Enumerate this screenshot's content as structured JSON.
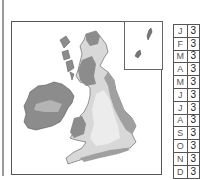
{
  "map": {
    "region": "British Isles",
    "shading_colors": {
      "dark": "#8c8c8c",
      "medium": "#b4b4b4",
      "light": "#d8d8d8",
      "lightest": "#ececec"
    },
    "inset": "Shetland Islands"
  },
  "legend_table": {
    "rows": [
      {
        "month": "J",
        "value": "3"
      },
      {
        "month": "F",
        "value": "3"
      },
      {
        "month": "M",
        "value": "3"
      },
      {
        "month": "A",
        "value": "3"
      },
      {
        "month": "M",
        "value": "3"
      },
      {
        "month": "J",
        "value": "3"
      },
      {
        "month": "J",
        "value": "3"
      },
      {
        "month": "A",
        "value": "3"
      },
      {
        "month": "S",
        "value": "3"
      },
      {
        "month": "O",
        "value": "3"
      },
      {
        "month": "N",
        "value": "3"
      },
      {
        "month": "D",
        "value": "3"
      }
    ]
  }
}
